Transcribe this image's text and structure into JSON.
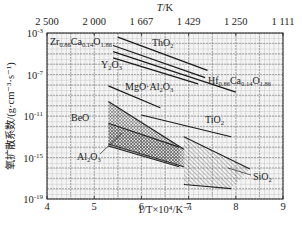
{
  "chart_data": {
    "type": "line",
    "title": "",
    "top_axis": {
      "label": "T/K",
      "ticks": [
        "2 500",
        "2 000",
        "1 667",
        "1 429",
        "1 250",
        "1 111"
      ]
    },
    "xlabel": "1/T×10⁴/K⁻¹",
    "ylabel": "氧扩散系数/(g·cm⁻³·s⁻¹)",
    "xlim": [
      4,
      9
    ],
    "ylim_log10": [
      -19,
      -3
    ],
    "x_ticks": [
      "4",
      "5",
      "6",
      "7",
      "8",
      "9"
    ],
    "y_ticks": [
      {
        "base": "10",
        "exp": "-3",
        "value": -3
      },
      {
        "base": "10",
        "exp": "-7",
        "value": -7
      },
      {
        "base": "10",
        "exp": "-11",
        "value": -11
      },
      {
        "base": "10",
        "exp": "-15",
        "value": -15
      },
      {
        "base": "10",
        "exp": "-19",
        "value": -19
      }
    ],
    "grid": true,
    "series": [
      {
        "name": "ThO₂",
        "x": [
          5.5,
          7.4
        ],
        "log10_y": [
          -3.4,
          -6.6
        ]
      },
      {
        "name": "Zr₀.₈₆Ca₀.₁₄O₁.₈₆",
        "x": [
          5.4,
          7.35
        ],
        "log10_y": [
          -4.2,
          -7.3
        ]
      },
      {
        "name": "Hf₀.₈₆Ca₀.₁₄O₁.₈₆",
        "x": [
          5.4,
          8.0
        ],
        "log10_y": [
          -4.8,
          -8.7
        ]
      },
      {
        "name": "Y₂O₃",
        "x": [
          5.4,
          7.2
        ],
        "log10_y": [
          -5.4,
          -7.9
        ]
      },
      {
        "name": "MgO·Al₂O₃",
        "x": [
          5.3,
          6.4
        ],
        "log10_y": [
          -8.1,
          -10.2
        ]
      },
      {
        "name": "TiO₂",
        "x": [
          6.0,
          7.9
        ],
        "log10_y": [
          -10.9,
          -13.0
        ]
      }
    ],
    "regions": [
      {
        "name": "BeO",
        "polygon": [
          [
            5.3,
            -9.6
          ],
          [
            6.9,
            -14.2
          ],
          [
            6.9,
            -15.9
          ],
          [
            5.3,
            -13.7
          ]
        ]
      },
      {
        "name": "Al₂O₃",
        "polygon": [
          [
            5.3,
            -11.7
          ],
          [
            6.8,
            -14.0
          ],
          [
            6.8,
            -15.9
          ],
          [
            5.3,
            -13.9
          ]
        ]
      },
      {
        "name": "SiO₂",
        "polygon": [
          [
            6.9,
            -13.0
          ],
          [
            8.3,
            -16.1
          ],
          [
            7.9,
            -18.0
          ],
          [
            6.9,
            -17.6
          ]
        ]
      }
    ],
    "labels": [
      {
        "text": "Zr",
        "sub1": "0.86",
        "mid": "Ca",
        "sub2": "0.14",
        "end": "O",
        "sub3": "1.86"
      },
      {
        "text": "ThO",
        "sub": "2"
      },
      {
        "text": "Y",
        "sub1": "2",
        "mid": "O",
        "sub2": "3"
      },
      {
        "text": "Hf",
        "sub1": "0.86",
        "mid": "Ca",
        "sub2": "0.14",
        "end": "O",
        "sub3": "1.86"
      },
      {
        "text": "MgO·Al",
        "sub1": "2",
        "mid": "O",
        "sub2": "3"
      },
      {
        "text": "BeO"
      },
      {
        "text": "TiO",
        "sub": "2"
      },
      {
        "text": "Al",
        "sub1": "2",
        "mid": "O",
        "sub2": "3"
      },
      {
        "text": "SiO",
        "sub": "2"
      }
    ]
  }
}
